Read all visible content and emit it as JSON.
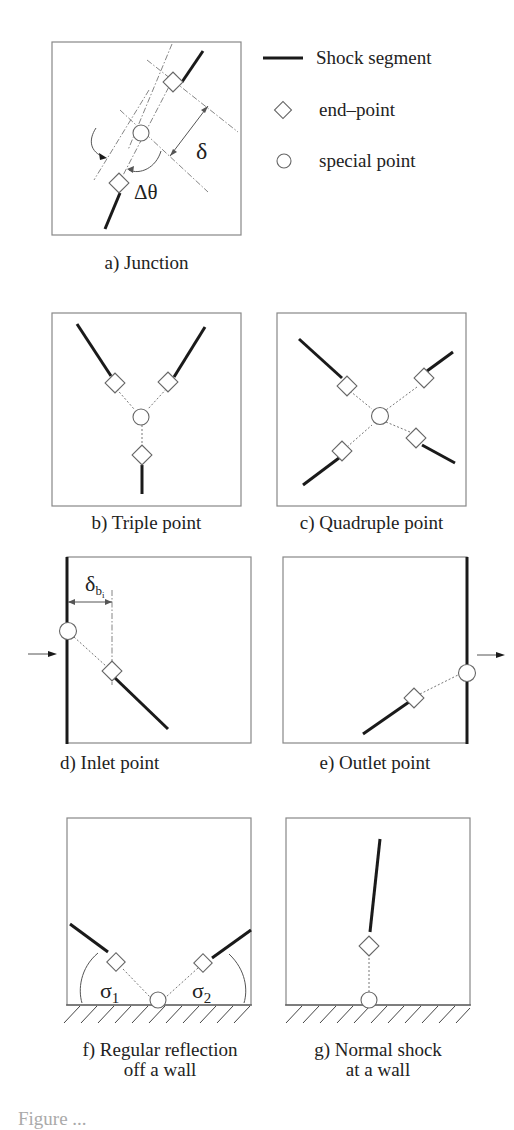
{
  "legend": {
    "items": [
      {
        "symbol": "line-icon",
        "label": "Shock segment"
      },
      {
        "symbol": "diamond-icon",
        "label": "end–point"
      },
      {
        "symbol": "circle-icon",
        "label": "special point"
      }
    ]
  },
  "panels": {
    "a": {
      "caption": "a) Junction",
      "delta_label": "δ",
      "dtheta_label": "Δθ"
    },
    "b": {
      "caption": "b) Triple point"
    },
    "c": {
      "caption": "c) Quadruple point"
    },
    "d": {
      "caption": "d) Inlet point",
      "delta_label": "δ",
      "delta_sub": "b",
      "delta_sub2": "i"
    },
    "e": {
      "caption": "e) Outlet point"
    },
    "f": {
      "caption_line1": "f) Regular reflection",
      "caption_line2": "off a wall",
      "sigma1": "σ",
      "sigma1_sub": "1",
      "sigma2": "σ",
      "sigma2_sub": "2"
    },
    "g": {
      "caption_line1": "g) Normal shock",
      "caption_line2": "at a wall"
    }
  },
  "colors": {
    "frame": "#888888",
    "shock": "#1a1a1a",
    "construction": "#777777",
    "background": "#ffffff"
  },
  "footer": {
    "cutoff_caption": "Figure ..."
  }
}
